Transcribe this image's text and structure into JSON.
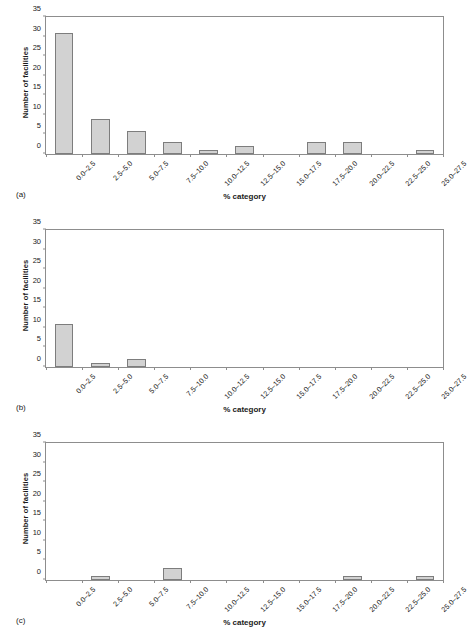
{
  "figure": {
    "width": 456,
    "height": 639,
    "background": "#ffffff",
    "bar_fill": "#d2d2d2",
    "bar_border": "#7d7d7d",
    "axis_color": "#8d8d8d"
  },
  "panels": [
    {
      "tag": "(a)"
    },
    {
      "tag": "(b)"
    },
    {
      "tag": "(c)"
    }
  ],
  "axes": {
    "ylabel": "Number of facilities",
    "xlabel": "% category",
    "yticks": [
      0,
      5,
      10,
      15,
      20,
      25,
      30,
      35
    ],
    "ylim": [
      0,
      35
    ],
    "categories": [
      "0.0–2.5",
      "2.5–5.0",
      "5.0–7.5",
      "7.5–10.0",
      "10.0–12.5",
      "12.5–15.0",
      "15.0–17.5",
      "17.5–20.0",
      "20.0–22.5",
      "22.5–25.0",
      "25.0–27.5"
    ]
  },
  "chart_data": [
    {
      "type": "bar",
      "panel": "(a)",
      "title": "",
      "xlabel": "% category",
      "ylabel": "Number of facilities",
      "ylim": [
        0,
        35
      ],
      "yticks": [
        0,
        5,
        10,
        15,
        20,
        25,
        30,
        35
      ],
      "grid": false,
      "legend": "none",
      "categories": [
        "0.0–2.5",
        "2.5–5.0",
        "5.0–7.5",
        "7.5–10.0",
        "10.0–12.5",
        "12.5–15.0",
        "15.0–17.5",
        "17.5–20.0",
        "20.0–22.5",
        "22.5–25.0",
        "25.0–27.5"
      ],
      "values": [
        31,
        9,
        6,
        3,
        1,
        2,
        0,
        3,
        3,
        0,
        1
      ]
    },
    {
      "type": "bar",
      "panel": "(b)",
      "title": "",
      "xlabel": "% category",
      "ylabel": "Number of facilities",
      "ylim": [
        0,
        35
      ],
      "yticks": [
        0,
        5,
        10,
        15,
        20,
        25,
        30,
        35
      ],
      "grid": false,
      "legend": "none",
      "categories": [
        "0.0–2.5",
        "2.5–5.0",
        "5.0–7.5",
        "7.5–10.0",
        "10.0–12.5",
        "12.5–15.0",
        "15.0–17.5",
        "17.5–20.0",
        "20.0–22.5",
        "22.5–25.0",
        "25.0–27.5"
      ],
      "values": [
        11,
        1,
        2,
        0,
        0,
        0,
        0,
        0,
        0,
        0,
        0
      ]
    },
    {
      "type": "bar",
      "panel": "(c)",
      "title": "",
      "xlabel": "% category",
      "ylabel": "Number of facilities",
      "ylim": [
        0,
        35
      ],
      "yticks": [
        0,
        5,
        10,
        15,
        20,
        25,
        30,
        35
      ],
      "grid": false,
      "legend": "none",
      "categories": [
        "0.0–2.5",
        "2.5–5.0",
        "5.0–7.5",
        "7.5–10.0",
        "10.0–12.5",
        "12.5–15.0",
        "15.0–17.5",
        "17.5–20.0",
        "20.0–22.5",
        "22.5–25.0",
        "25.0–27.5"
      ],
      "values": [
        0,
        1,
        0,
        3,
        0,
        0,
        0,
        0,
        1,
        0,
        1
      ]
    }
  ]
}
